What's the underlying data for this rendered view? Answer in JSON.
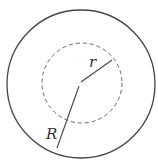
{
  "diagram": {
    "outer_circle": {
      "label": "R",
      "style": "solid"
    },
    "inner_circle": {
      "label": "r",
      "style": "dashed"
    },
    "colors": {
      "stroke": "#444444",
      "dashed_stroke": "#666666",
      "background": "#ffffff"
    }
  }
}
